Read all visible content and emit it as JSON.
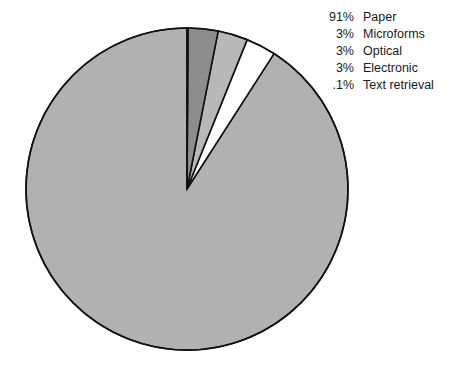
{
  "canvas": {
    "width": 452,
    "height": 381,
    "background": "#ffffff"
  },
  "chart_data": {
    "type": "pie",
    "title": "",
    "subtitle": "",
    "xlabel": "",
    "ylabel": "",
    "grid": false,
    "legend_position": "top-right",
    "start_angle_deg": 0,
    "direction": "counterclockwise",
    "center": {
      "x": 187,
      "y": 189
    },
    "radius": 161,
    "outline_color": "#111111",
    "outline_width": 1.6,
    "categories": [
      "Paper",
      "Microforms",
      "Optical",
      "Electronic",
      "Text retrieval"
    ],
    "values": [
      91,
      3,
      3,
      3,
      0.1
    ],
    "value_labels": [
      "91%",
      "3%",
      "3%",
      "3%",
      ".1%"
    ],
    "colors": [
      "#b1b1b1",
      "#ffffff",
      "#b8b8b8",
      "#8d8d8d",
      "#1a1a1a"
    ],
    "slices": [
      {
        "label": "Paper",
        "value": 91,
        "value_label": "91%",
        "color": "#b1b1b1"
      },
      {
        "label": "Microforms",
        "value": 3,
        "value_label": "3%",
        "color": "#ffffff"
      },
      {
        "label": "Optical",
        "value": 3,
        "value_label": "3%",
        "color": "#b8b8b8"
      },
      {
        "label": "Electronic",
        "value": 3,
        "value_label": "3%",
        "color": "#8d8d8d"
      },
      {
        "label": "Text retrieval",
        "value": 0.1,
        "value_label": ".1%",
        "color": "#1a1a1a"
      }
    ]
  },
  "legend": {
    "rows": [
      {
        "pct": "91%",
        "label": "Paper",
        "swatch": "#b1b1b1"
      },
      {
        "pct": "3%",
        "label": "Microforms",
        "swatch": "#ffffff"
      },
      {
        "pct": "3%",
        "label": "Optical",
        "swatch": "#b8b8b8"
      },
      {
        "pct": "3%",
        "label": "Electronic",
        "swatch": "#8d8d8d"
      },
      {
        "pct": ".1%",
        "label": "Text retrieval",
        "swatch": "#1a1a1a"
      }
    ]
  }
}
